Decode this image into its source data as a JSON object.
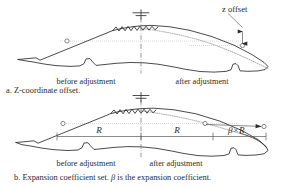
{
  "figure": {
    "panel_a": {
      "caption": "a. Z-coordinate offset.",
      "label_before": "before adjustment",
      "label_after": "after adjustment",
      "annotation_offset": "z offset",
      "datum_icon": "datum-ground-icon",
      "break_icon": "zigzag-break-icon",
      "centerline_icon": "dash-dot-centerline-icon"
    },
    "panel_b": {
      "caption_parts": {
        "lead": "b. Expansion coefficient set. ",
        "symbol": "β",
        "tail": " is the expansion coefficient."
      },
      "caption_full": "b. Expansion coefficient set. β is the expansion coefficient.",
      "label_before": "before adjustment",
      "label_after": "after adjustment",
      "dim_left": "R",
      "dim_right": "R",
      "dim_expansion_parts": {
        "symbol": "β",
        "operator": "×",
        "radius": "R"
      },
      "dim_expansion_full": "β×R",
      "datum_icon": "datum-ground-icon",
      "break_icon": "zigzag-break-icon",
      "centerline_icon": "dash-dot-centerline-icon"
    },
    "colors": {
      "outline": "#2b2b2b",
      "dotted_profile": "#8d8d8d",
      "centerline": "#6e6e6e",
      "dimension": "#5a5a5a",
      "text": "#2a2a2a",
      "background": "#ffffff"
    }
  }
}
